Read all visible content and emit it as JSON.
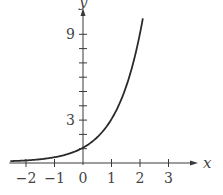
{
  "chart_data": {
    "type": "line",
    "title": "",
    "xlabel": "x",
    "ylabel": "y",
    "function": "y = 3^x",
    "xlim": [
      -2.55,
      3.6
    ],
    "ylim": [
      0,
      10.6
    ],
    "grid": false,
    "legend": null,
    "x_ticks": [
      -2,
      -1,
      0,
      1,
      2,
      3
    ],
    "x_tick_labels": [
      "−2",
      "−1",
      "0",
      "1",
      "2",
      "3"
    ],
    "y_ticks": [
      1,
      2,
      3,
      4,
      5,
      6,
      7,
      8,
      9
    ],
    "y_tick_labels": [
      {
        "value": 3,
        "label": "3"
      },
      {
        "value": 9,
        "label": "9"
      }
    ],
    "series": [
      {
        "name": "y = 3^x",
        "x": [
          -2.55,
          -2,
          -1.5,
          -1,
          -0.5,
          0,
          0.5,
          1,
          1.5,
          2,
          2.1
        ],
        "y": [
          0.06,
          0.11,
          0.19,
          0.33,
          0.58,
          1.0,
          1.73,
          3.0,
          5.2,
          9.0,
          10.05
        ]
      }
    ]
  },
  "layout": {
    "origin_px": [
      83,
      163
    ],
    "px_per_x": 28.5,
    "px_per_y": 14.3,
    "x_axis_end_px": 198,
    "y_axis_top_px": 8
  }
}
